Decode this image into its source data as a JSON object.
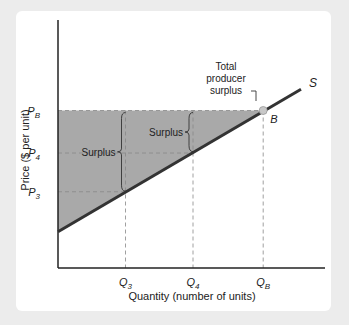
{
  "chart_data": {
    "type": "line",
    "title": "",
    "xlabel": "Quantity (number of units)",
    "ylabel": "Price ($ per unit)",
    "xlim": [
      0,
      10
    ],
    "ylim": [
      0,
      10
    ],
    "grid": false,
    "series": [
      {
        "name": "S",
        "label": "S",
        "points": [
          [
            0,
            1.45
          ],
          [
            9.0,
            7.15
          ]
        ],
        "color": "#333333"
      }
    ],
    "point_B": {
      "label": "B",
      "x": 7.6,
      "y": 6.3
    },
    "x_ticks": [
      {
        "label": "Q",
        "sub": "3",
        "x": 2.5
      },
      {
        "label": "Q",
        "sub": "4",
        "x": 5.0
      },
      {
        "label": "Q",
        "sub": "B",
        "x": 7.6
      }
    ],
    "y_ticks": [
      {
        "label": "P",
        "sub": "B",
        "y": 6.3
      },
      {
        "label": "P",
        "sub": "4",
        "y": 4.6
      },
      {
        "label": "P",
        "sub": "3",
        "y": 3.05
      }
    ],
    "shaded_region": {
      "name": "Total producer surplus",
      "color": "#a9a9a9"
    },
    "annotations": [
      {
        "id": "total",
        "lines": [
          "Total",
          "producer",
          "surplus"
        ]
      },
      {
        "id": "surplus_q3",
        "text": "Surplus"
      },
      {
        "id": "surplus_q4",
        "text": "Surplus"
      }
    ]
  }
}
